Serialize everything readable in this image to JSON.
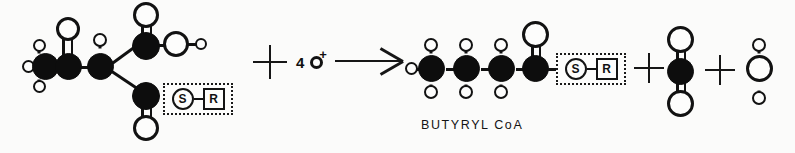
{
  "figure": {
    "kind": "biochemical-reaction-space-filling-diagram",
    "caption": "BUTYRYL CoA",
    "background_color": "#fbfbfa",
    "carbon_color": "#0d0d0d",
    "oxygen_color": "#fdfdfc",
    "outline_color": "#121212"
  },
  "operators": {
    "plus_1": "+",
    "plus_2": "+",
    "plus_3": "+",
    "arrow": "→"
  },
  "reagent": {
    "count": "4",
    "atom_icon": "hydrogen-atom-circle",
    "charge": "+",
    "full_label": "4 o+"
  },
  "coa_group": {
    "sulfur_label": "S",
    "r_label": "R",
    "sulfur_icon": "sulfur-circle-icon",
    "r_icon": "r-square-icon",
    "box_style": "dotted"
  },
  "reactant": {
    "name": "acetoacetyl-CoA-like substrate",
    "atoms": [
      {
        "id": "C1",
        "element": "C",
        "role": "methyl-carbon"
      },
      {
        "id": "H1",
        "element": "H",
        "role": "methyl-hydrogen-left"
      },
      {
        "id": "H2",
        "element": "H",
        "role": "methyl-hydrogen-top"
      },
      {
        "id": "H3",
        "element": "H",
        "role": "methyl-hydrogen-bottom"
      },
      {
        "id": "C2",
        "element": "C",
        "role": "carbonyl-carbon"
      },
      {
        "id": "O1",
        "element": "O",
        "role": "ketone-oxygen",
        "bond": "double"
      },
      {
        "id": "C3",
        "element": "C",
        "role": "alpha-carbon"
      },
      {
        "id": "H4",
        "element": "H",
        "role": "alpha-hydrogen"
      },
      {
        "id": "C4",
        "element": "C",
        "role": "carboxyl-carbon"
      },
      {
        "id": "O2",
        "element": "O",
        "role": "carboxyl-oxygen-double",
        "bond": "double"
      },
      {
        "id": "O3",
        "element": "O",
        "role": "carboxyl-hydroxyl-oxygen"
      },
      {
        "id": "H5",
        "element": "H",
        "role": "hydroxyl-hydrogen"
      },
      {
        "id": "C5",
        "element": "C",
        "role": "thioester-carbonyl-carbon"
      },
      {
        "id": "O4",
        "element": "O",
        "role": "thioester-oxygen",
        "bond": "double"
      }
    ]
  },
  "product_butyryl": {
    "name": "BUTYRYL CoA",
    "chain_carbons": 4,
    "atoms": [
      {
        "id": "C1",
        "element": "C",
        "role": "terminal-methyl-carbon"
      },
      {
        "id": "C2",
        "element": "C",
        "role": "chain-carbon"
      },
      {
        "id": "C3",
        "element": "C",
        "role": "chain-carbon"
      },
      {
        "id": "C4",
        "element": "C",
        "role": "thioester-carbonyl-carbon"
      },
      {
        "id": "O1",
        "element": "O",
        "role": "thioester-oxygen",
        "bond": "double"
      }
    ]
  },
  "product_co2": {
    "name": "carbon dioxide",
    "center": {
      "element": "C"
    },
    "oxygens": 2,
    "bond": "double"
  },
  "product_water": {
    "name": "water",
    "center": {
      "element": "O"
    },
    "hydrogens": 2,
    "bond": "single"
  }
}
